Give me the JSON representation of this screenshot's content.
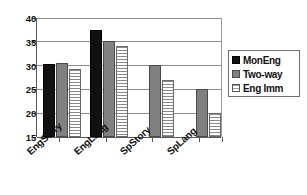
{
  "chart_data": {
    "type": "bar",
    "title": "",
    "xlabel": "",
    "ylabel": "",
    "ylim": [
      15,
      40
    ],
    "yticks": [
      15,
      20,
      25,
      30,
      35,
      40
    ],
    "ytick_labels": [
      "15",
      "20",
      "25",
      "30",
      "35",
      "40"
    ],
    "grid": true,
    "legend_position": "right",
    "categories": [
      "EngStory",
      "EngLang",
      "SpStory",
      "SpLang"
    ],
    "series": [
      {
        "name": "MonEng",
        "color": "#111111",
        "fill": "solid-black",
        "values": [
          30.3,
          37.5,
          null,
          null
        ]
      },
      {
        "name": "Two-way",
        "color": "#808080",
        "fill": "solid-gray",
        "values": [
          30.6,
          35.2,
          30.2,
          25.0
        ]
      },
      {
        "name": "Eng Imm",
        "color": "#ffffff",
        "fill": "horizontal-hatch",
        "values": [
          29.2,
          34.2,
          27.0,
          20.0
        ]
      }
    ]
  }
}
